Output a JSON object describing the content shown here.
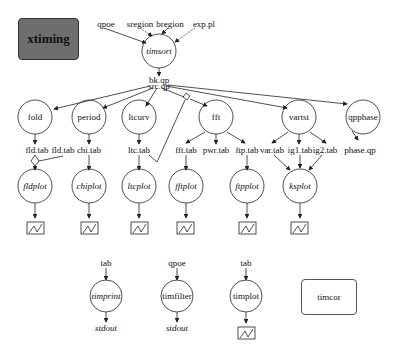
{
  "title": "xtiming",
  "inputs": [
    "qpoe",
    "sregion",
    "bregion",
    "exp.pl"
  ],
  "central_task": "timsort",
  "central_outputs": [
    "bk.qp",
    "src.qp"
  ],
  "tasks": [
    {
      "name": "fold",
      "outputs": [
        "fld.tab",
        "fld.tab"
      ],
      "plot": "fldplot"
    },
    {
      "name": "period",
      "outputs": [
        "chi.tab"
      ],
      "plot": "chiplot"
    },
    {
      "name": "ltcurv",
      "outputs": [
        "ltc.tab"
      ],
      "plot": "ltcplot"
    },
    {
      "name": "fft",
      "outputs": [
        "fft.tab",
        "pwr.tab",
        "ftp.tab"
      ],
      "plots": [
        "fftplot",
        "ftpplot"
      ]
    },
    {
      "name": "vartst",
      "outputs": [
        "var.tab",
        "ig1.tab",
        "ig2.tab"
      ],
      "plot": "ksplot"
    },
    {
      "name": "qpphase",
      "outputs": [
        "phase.qp"
      ]
    }
  ],
  "standalone": [
    {
      "input": "tab",
      "task": "timprint",
      "output": "stdout"
    },
    {
      "input": "qpoe",
      "task": "timfilter",
      "output": "stdout"
    },
    {
      "input": "tab",
      "task": "timplot",
      "output": "graph"
    },
    {
      "task": "timcor"
    }
  ],
  "labels": {
    "qpoe": "qpoe",
    "sregion": "sregion",
    "bregion": "bregion",
    "exp_pl": "exp.pl",
    "timsort": "timsort",
    "bk_qp": "bk.qp",
    "src_qp": "src.qp",
    "fold": "fold",
    "period": "period",
    "ltcurv": "ltcurv",
    "fft": "fft",
    "vartst": "vartst",
    "qpphase": "qpphase",
    "fld_tab_1": "fld.tab",
    "fld_tab_2": "fld.tab",
    "chi_tab": "chi.tab",
    "ltc_tab": "ltc.tab",
    "fft_tab": "fft.tab",
    "pwr_tab": "pwr.tab",
    "ftp_tab": "ftp.tab",
    "var_tab": "var.tab",
    "ig1_tab": "ig1.tab",
    "ig2_tab": "ig2.tab",
    "phase_qp": "phase.qp",
    "fldplot": "fldplot",
    "chiplot": "chiplot",
    "ltcplot": "ltcplot",
    "fftplot": "fftplot",
    "ftpplot": "ftpplot",
    "ksplot": "ksplot",
    "tab1": "tab",
    "qpoe2": "qpoe",
    "tab3": "tab",
    "timprint": "timprint",
    "timfilter": "timfilter",
    "timplot": "timplot",
    "timcor": "timcor",
    "stdout1": "stdout",
    "stdout2": "stdout"
  },
  "colors": {
    "title_fill": "#6e6e6e",
    "stroke": "#222222"
  }
}
